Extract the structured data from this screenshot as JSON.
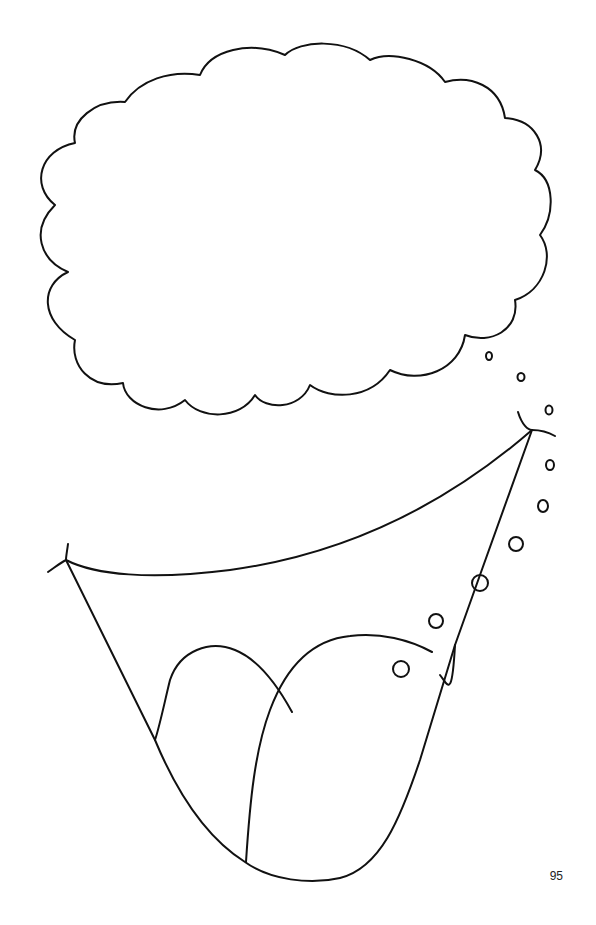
{
  "page": {
    "number": "95",
    "ink_color": "#111111",
    "background_color": "#ffffff"
  },
  "illustration": {
    "elements": [
      {
        "name": "thought-cloud",
        "description": "empty scalloped thought bubble"
      },
      {
        "name": "thought-bubbles",
        "count": 3,
        "description": "small trailing circles from cloud"
      },
      {
        "name": "open-mouth",
        "description": "wide open mouth with corner creases"
      },
      {
        "name": "tongue",
        "description": "tongue with center line inside mouth"
      },
      {
        "name": "saliva-bubbles",
        "count": 7,
        "description": "circles along right edge of mouth"
      }
    ]
  }
}
